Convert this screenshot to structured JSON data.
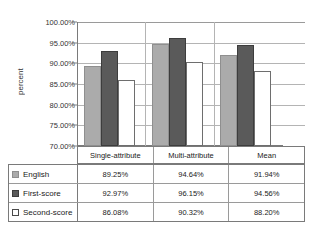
{
  "chart_data": {
    "type": "bar",
    "title": "",
    "xlabel": "",
    "ylabel": "percent",
    "categories": [
      "Single-attribute",
      "Multi-attribute",
      "Mean"
    ],
    "series": [
      {
        "name": "English",
        "values": [
          89.25,
          94.64,
          91.94
        ],
        "color": "#ababab"
      },
      {
        "name": "First-score",
        "values": [
          92.97,
          96.15,
          94.56
        ],
        "color": "#5a5a5a"
      },
      {
        "name": "Second-score",
        "values": [
          86.08,
          90.32,
          88.2
        ],
        "color": "#ffffff"
      }
    ],
    "value_labels": [
      [
        "89.25%",
        "94.64%",
        "91.94%"
      ],
      [
        "92.97%",
        "96.15%",
        "94.56%"
      ],
      [
        "86.08%",
        "90.32%",
        "88.20%"
      ]
    ],
    "ylim": [
      70,
      100
    ],
    "ytick_values": [
      100,
      95,
      90,
      85,
      80,
      75,
      70
    ],
    "ytick_labels": [
      "100.00%",
      "95.00%",
      "90.00%",
      "85.00%",
      "80.00%",
      "75.00%",
      "70.00%"
    ],
    "grid": true,
    "legend_position": "bottom-table"
  }
}
